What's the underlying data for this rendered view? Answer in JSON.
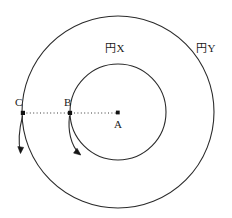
{
  "figure": {
    "kind": "geometry-diagram",
    "background_color": "#ffffff",
    "stroke_color": "#2b2b2b",
    "width": 232,
    "height": 218,
    "circles": [
      {
        "id": "circle-x",
        "label": "円X",
        "role": "inner-circle",
        "center": {
          "x": 118,
          "y": 112
        },
        "radius": 48
      },
      {
        "id": "circle-y",
        "label": "円Y",
        "role": "outer-circle",
        "center": {
          "x": 118,
          "y": 112
        },
        "radius": 96
      }
    ],
    "points": [
      {
        "id": "point-a",
        "label": "A",
        "role": "center",
        "x": 118,
        "y": 113
      },
      {
        "id": "point-b",
        "label": "B",
        "role": "on-inner-circle",
        "x": 70,
        "y": 113
      },
      {
        "id": "point-c",
        "label": "C",
        "role": "on-outer-circle",
        "x": 23,
        "y": 113
      }
    ],
    "radius_line": {
      "id": "radius-line",
      "style": "dotted",
      "from": {
        "x": 23,
        "y": 113
      },
      "to": {
        "x": 118,
        "y": 113
      }
    },
    "arrows": [
      {
        "id": "arrow-from-c",
        "from_point": "C",
        "direction": "clockwise",
        "description": "curved arrow descending from point C along outer circle"
      },
      {
        "id": "arrow-from-b",
        "from_point": "B",
        "direction": "clockwise",
        "description": "curved arrow descending from point B along inner circle"
      }
    ]
  }
}
